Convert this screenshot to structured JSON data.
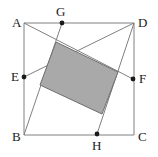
{
  "figure": {
    "name": "geometry-figure-shaded-parallelogram-in-square",
    "canvas": {
      "width": 158,
      "height": 157
    },
    "colors": {
      "background": "#ffffff",
      "stroke": "#808080",
      "shaded_fill": "#a9a9a9",
      "shaded_stroke": "#6e6e6e",
      "point_marker": "#1a1a1a",
      "label_text": "#1a1a1a"
    },
    "stroke_width": 1,
    "point_marker_radius": 2.4,
    "label_font_size": 13,
    "outline": {
      "name": "quadrilateral-ABCD",
      "vertex_order": [
        "A",
        "D",
        "C",
        "B"
      ],
      "closed": true
    },
    "vertices": [
      {
        "id": "A",
        "label": "A",
        "x": 24,
        "y": 23,
        "label_x": 12,
        "label_y": 16,
        "marker": false
      },
      {
        "id": "D",
        "label": "D",
        "x": 134,
        "y": 23,
        "label_x": 138,
        "label_y": 16,
        "marker": false
      },
      {
        "id": "C",
        "label": "C",
        "x": 134,
        "y": 135,
        "label_x": 138,
        "label_y": 130,
        "marker": false
      },
      {
        "id": "B",
        "label": "B",
        "x": 24,
        "y": 135,
        "label_x": 12,
        "label_y": 130,
        "marker": false
      }
    ],
    "points": [
      {
        "id": "G",
        "label": "G",
        "x": 62,
        "y": 23,
        "on_segment": "A-D",
        "label_x": 56,
        "label_y": 5,
        "marker": true
      },
      {
        "id": "F",
        "label": "F",
        "x": 133,
        "y": 79,
        "on_segment": "D-C",
        "label_x": 139,
        "label_y": 72,
        "marker": true
      },
      {
        "id": "H",
        "label": "H",
        "x": 97,
        "y": 134,
        "on_segment": "B-C",
        "label_x": 92,
        "label_y": 139,
        "marker": true
      },
      {
        "id": "E",
        "label": "E",
        "x": 24,
        "y": 77,
        "on_segment": "A-B",
        "label_x": 11,
        "label_y": 70,
        "marker": true
      }
    ],
    "cevians": [
      {
        "name": "segment-A-F",
        "from": "A",
        "to": "F",
        "x1": 24,
        "y1": 23,
        "x2": 133,
        "y2": 79
      },
      {
        "name": "segment-E-D",
        "from": "E",
        "to": "D",
        "x1": 24,
        "y1": 77,
        "x2": 134,
        "y2": 23
      },
      {
        "name": "segment-B-G",
        "from": "B",
        "to": "G",
        "x1": 24,
        "y1": 135,
        "x2": 62,
        "y2": 23
      },
      {
        "name": "segment-H-D",
        "from": "H",
        "to": "D",
        "x1": 97,
        "y1": 134,
        "x2": 134,
        "y2": 23
      }
    ],
    "shaded_region": {
      "name": "shaded-parallelogram",
      "points": "56,42 118,72 102,114 40,85",
      "vertices": [
        {
          "x": 56,
          "y": 42
        },
        {
          "x": 118,
          "y": 72
        },
        {
          "x": 102,
          "y": 114
        },
        {
          "x": 40,
          "y": 85
        }
      ]
    }
  }
}
